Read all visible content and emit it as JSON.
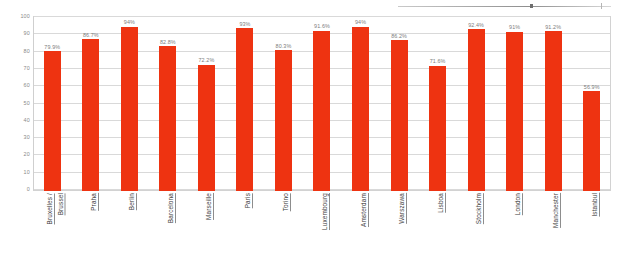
{
  "chart_data": {
    "type": "bar",
    "title": "",
    "xlabel": "",
    "ylabel": "",
    "ylim": [
      0,
      100
    ],
    "ytick_step": 10,
    "grid": true,
    "legend": "none",
    "value_suffix": "%",
    "bar_color": "#ee3311",
    "categories": [
      "Bruxelles / Brussel",
      "Praha",
      "Berlin",
      "Barcelona",
      "Marseille",
      "Paris",
      "Torino",
      "Luxembourg",
      "Amsterdam",
      "Warszawa",
      "Lisboa",
      "Stockholm",
      "London",
      "Manchester",
      "Istanbul"
    ],
    "values": [
      79.9,
      86.7,
      94,
      82.8,
      72.2,
      93,
      80.3,
      91.6,
      94,
      86.2,
      71.6,
      92.4,
      91,
      91.2,
      56.9
    ],
    "data_labels": [
      "79.9%",
      "86.7%",
      "94%",
      "82.8%",
      "72.2%",
      "93%",
      "80.3%",
      "91.6%",
      "94%",
      "86.2%",
      "71.6%",
      "92.4%",
      "91%",
      "91.2%",
      "56.9%"
    ],
    "ytick_labels": [
      "0",
      "10",
      "20",
      "30",
      "40",
      "50",
      "60",
      "70",
      "80",
      "90",
      "100"
    ],
    "category_lines": [
      [
        "Bruxelles /",
        "Brussel"
      ],
      [
        "Praha"
      ],
      [
        "Berlin"
      ],
      [
        "Barcelona"
      ],
      [
        "Marseille"
      ],
      [
        "Paris"
      ],
      [
        "Torino"
      ],
      [
        "Luxembourg"
      ],
      [
        "Amsterdam"
      ],
      [
        "Warszawa"
      ],
      [
        "Lisboa"
      ],
      [
        "Stockholm"
      ],
      [
        "London"
      ],
      [
        "Manchester"
      ],
      [
        "Istanbul"
      ]
    ]
  }
}
